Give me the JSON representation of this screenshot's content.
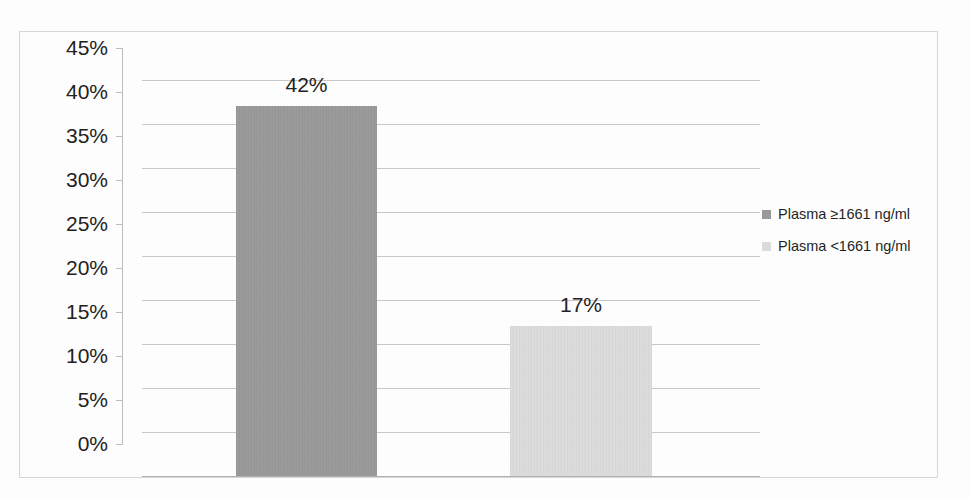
{
  "chart_data": {
    "type": "bar",
    "title": "",
    "subtitle": "",
    "xlabel": "",
    "ylabel": "",
    "categories": [
      "Plasma ≥1661 ng/ml",
      "Plasma <1661 ng/ml"
    ],
    "values": [
      42,
      17
    ],
    "value_labels": [
      "42%",
      "17%"
    ],
    "ylim": [
      0,
      45
    ],
    "ytick_step": 5,
    "ytick_labels": [
      "45%",
      "40%",
      "35%",
      "30%",
      "25%",
      "20%",
      "15%",
      "10%",
      "5%",
      "0%"
    ],
    "ytick_values": [
      45,
      40,
      35,
      30,
      25,
      20,
      15,
      10,
      5,
      0
    ],
    "grid": true,
    "legend_position": "right",
    "series": [
      {
        "name": "Plasma ≥1661 ng/ml",
        "value": 42,
        "label": "42%",
        "color": "#9a9a9a"
      },
      {
        "name": "Plasma <1661 ng/ml",
        "value": 17,
        "label": "17%",
        "color": "#dcdcdc"
      }
    ]
  },
  "legend": {
    "items": [
      {
        "label": "Plasma ≥1661 ng/ml",
        "color": "#9a9a9a",
        "swatch_icon": "legend-swatch-dark-icon"
      },
      {
        "label": "Plasma <1661 ng/ml",
        "color": "#dcdcdc",
        "swatch_icon": "legend-swatch-light-icon"
      }
    ]
  },
  "colors": {
    "bar_high": "#9a9a9a",
    "bar_low": "#dcdcdc",
    "gridline": "#c9c9c9",
    "axis": "#bdbdbd",
    "frame": "#d7d7d7",
    "text": "#222222",
    "background": "#ffffff"
  }
}
